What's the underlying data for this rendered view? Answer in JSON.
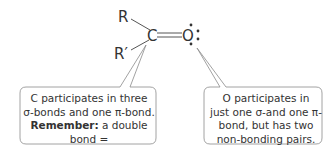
{
  "molecule": {
    "substituent_top": "R",
    "substituent_bottom": "R′",
    "carbon": "C",
    "oxygen": "O",
    "bond": "double",
    "lone_pairs_on_oxygen": 2
  },
  "callouts": {
    "left": {
      "line1": "C participates in three",
      "line2": "σ-bonds and one π-bond.",
      "line3_bold": "Remember:",
      "line3_rest": " a double bond =",
      "line4": "one σ-and one π-bond."
    },
    "right": {
      "line1": "O participates in",
      "line2": "just one σ-and one π-",
      "line3": "bond, but has two",
      "line4": "non-bonding pairs."
    }
  },
  "colors": {
    "line": "#555555",
    "box_border": "#8a8a8a",
    "text": "#333333"
  }
}
